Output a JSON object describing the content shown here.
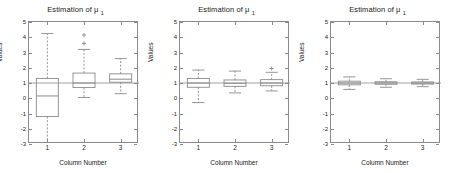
{
  "figure": {
    "width": 453,
    "height": 173,
    "background": "#ffffff",
    "line_color": "#8a8a8a",
    "text_color": "#1a1a1a",
    "reference_line_value": 1
  },
  "chart_data": [
    {
      "type": "box",
      "panel_index": 0,
      "title": "Estimation of μ",
      "title_subscript": "1",
      "xlabel": "Column Number",
      "ylabel": "Values",
      "categories": [
        "1",
        "2",
        "3"
      ],
      "xticklabels": [
        "1",
        "2",
        "3"
      ],
      "yticklabels": [
        "-3",
        "-2",
        "-1",
        "0",
        "1",
        "2",
        "3",
        "4",
        "5"
      ],
      "ylim": [
        -3,
        5
      ],
      "xlim": [
        0.5,
        3.5
      ],
      "grid": false,
      "legend": null,
      "reference_line": 1,
      "boxes": [
        {
          "category": "1",
          "whisker_low": -2.9,
          "q1": -1.2,
          "median": 0.15,
          "q3": 1.3,
          "whisker_high": 4.25,
          "outliers": []
        },
        {
          "category": "2",
          "whisker_low": 0.05,
          "q1": 0.7,
          "median": 1.0,
          "q3": 1.65,
          "whisker_high": 3.2,
          "outliers": [
            3.6,
            4.15
          ]
        },
        {
          "category": "3",
          "whisker_low": 0.3,
          "q1": 1.05,
          "median": 1.25,
          "q3": 1.6,
          "whisker_high": 2.6,
          "outliers": []
        }
      ]
    },
    {
      "type": "box",
      "panel_index": 1,
      "title": "Estimation of μ",
      "title_subscript": "1",
      "xlabel": "Column Number",
      "ylabel": "Values",
      "categories": [
        "1",
        "2",
        "3"
      ],
      "xticklabels": [
        "1",
        "2",
        "3"
      ],
      "yticklabels": [
        "-3",
        "-2",
        "-1",
        "0",
        "1",
        "2",
        "3",
        "4",
        "5"
      ],
      "ylim": [
        -3,
        5
      ],
      "xlim": [
        0.5,
        3.5
      ],
      "grid": false,
      "legend": null,
      "reference_line": 1,
      "boxes": [
        {
          "category": "1",
          "whisker_low": -0.28,
          "q1": 0.72,
          "median": 1.0,
          "q3": 1.3,
          "whisker_high": 1.85,
          "outliers": []
        },
        {
          "category": "2",
          "whisker_low": 0.35,
          "q1": 0.78,
          "median": 0.98,
          "q3": 1.2,
          "whisker_high": 1.78,
          "outliers": []
        },
        {
          "category": "3",
          "whisker_low": 0.48,
          "q1": 0.82,
          "median": 1.0,
          "q3": 1.22,
          "whisker_high": 1.7,
          "outliers": [
            1.95
          ]
        }
      ]
    },
    {
      "type": "box",
      "panel_index": 2,
      "title": "Estimation of μ",
      "title_subscript": "1",
      "xlabel": "Column Number",
      "ylabel": "Values",
      "categories": [
        "1",
        "2",
        "3"
      ],
      "xticklabels": [
        "1",
        "2",
        "3"
      ],
      "yticklabels": [
        "-3",
        "-2",
        "-1",
        "0",
        "1",
        "2",
        "3",
        "4",
        "5"
      ],
      "ylim": [
        -3,
        5
      ],
      "xlim": [
        0.5,
        3.5
      ],
      "grid": false,
      "legend": null,
      "reference_line": 1,
      "boxes": [
        {
          "category": "1",
          "whisker_low": 0.58,
          "q1": 0.88,
          "median": 1.0,
          "q3": 1.12,
          "whisker_high": 1.4,
          "outliers": []
        },
        {
          "category": "2",
          "whisker_low": 0.72,
          "q1": 0.92,
          "median": 1.0,
          "q3": 1.08,
          "whisker_high": 1.28,
          "outliers": []
        },
        {
          "category": "3",
          "whisker_low": 0.76,
          "q1": 0.93,
          "median": 1.0,
          "q3": 1.07,
          "whisker_high": 1.24,
          "outliers": []
        }
      ]
    }
  ]
}
